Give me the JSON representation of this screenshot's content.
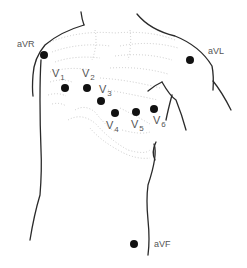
{
  "colors": {
    "outline": "#2a2a2a",
    "electrode": "#111111",
    "label": "#555555",
    "ribs": "#bdbdbd"
  },
  "limb_leads": [
    {
      "id": "aVR",
      "label": "aVR",
      "x": 44,
      "y": 55
    },
    {
      "id": "aVL",
      "label": "aVL",
      "x": 190,
      "y": 60
    },
    {
      "id": "aVF",
      "label": "aVF",
      "x": 134,
      "y": 244
    }
  ],
  "precordial_leads": [
    {
      "id": "V1",
      "letter": "V",
      "num": "1",
      "x": 65,
      "y": 88
    },
    {
      "id": "V2",
      "letter": "V",
      "num": "2",
      "x": 87,
      "y": 88
    },
    {
      "id": "V3",
      "letter": "V",
      "num": "3",
      "x": 101,
      "y": 101
    },
    {
      "id": "V4",
      "letter": "V",
      "num": "4",
      "x": 115,
      "y": 113
    },
    {
      "id": "V5",
      "letter": "V",
      "num": "5",
      "x": 136,
      "y": 112
    },
    {
      "id": "V6",
      "letter": "V",
      "num": "6",
      "x": 154,
      "y": 109
    }
  ]
}
